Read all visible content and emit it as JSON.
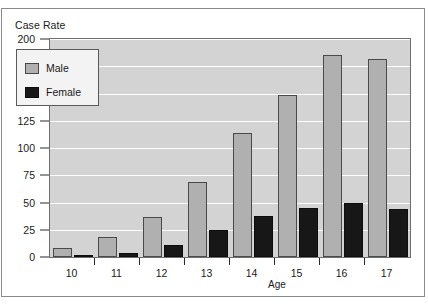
{
  "figure": {
    "ylabel": "Case Rate",
    "xlabel": "Age"
  },
  "legend": {
    "items": [
      {
        "label": "Male",
        "color": "#b0b0b0"
      },
      {
        "label": "Female",
        "color": "#171717"
      }
    ]
  },
  "axes": {
    "yticks": [
      "0",
      "25",
      "50",
      "75",
      "100",
      "125",
      "150",
      "175",
      "200"
    ],
    "xticks": [
      "10",
      "11",
      "12",
      "13",
      "14",
      "15",
      "16",
      "17"
    ]
  },
  "chart_data": {
    "type": "bar",
    "title": "",
    "xlabel": "Age",
    "ylabel": "Case Rate",
    "categories": [
      "10",
      "11",
      "12",
      "13",
      "14",
      "15",
      "16",
      "17"
    ],
    "series": [
      {
        "name": "Male",
        "color": "#b0b0b0",
        "values": [
          8,
          18,
          37,
          69,
          114,
          149,
          185,
          182
        ]
      },
      {
        "name": "Female",
        "color": "#171717",
        "values": [
          2,
          4,
          11,
          25,
          38,
          45,
          50,
          44
        ]
      }
    ],
    "ylim": [
      0,
      200
    ],
    "ytick_step": 25,
    "grid": true,
    "grid_color": "#ffffff",
    "plot_background": "#d3d3d3",
    "legend_position": "upper left"
  }
}
